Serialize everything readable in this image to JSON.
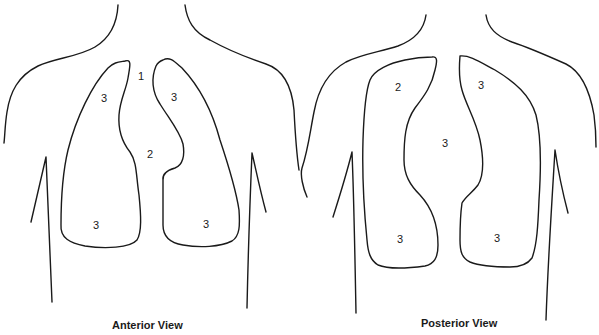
{
  "figure": {
    "panels": [
      {
        "id": "anterior",
        "caption": "Anterior View",
        "labels": [
          {
            "text": "1",
            "region": "suprasternal"
          },
          {
            "text": "2",
            "region": "mediastinum"
          },
          {
            "text": "3",
            "region": "right-upper-lung"
          },
          {
            "text": "3",
            "region": "left-upper-lung"
          },
          {
            "text": "3",
            "region": "right-lower-lung"
          },
          {
            "text": "3",
            "region": "left-lower-lung"
          }
        ]
      },
      {
        "id": "posterior",
        "caption": "Posterior View",
        "labels": [
          {
            "text": "2",
            "region": "mediastinum"
          },
          {
            "text": "3",
            "region": "left-upper-lung"
          },
          {
            "text": "3",
            "region": "right-upper-lung"
          },
          {
            "text": "3",
            "region": "left-lower-lung"
          },
          {
            "text": "3",
            "region": "right-lower-lung"
          }
        ]
      }
    ],
    "colors": {
      "line": "#1a1a1a",
      "background": "#ffffff"
    }
  }
}
